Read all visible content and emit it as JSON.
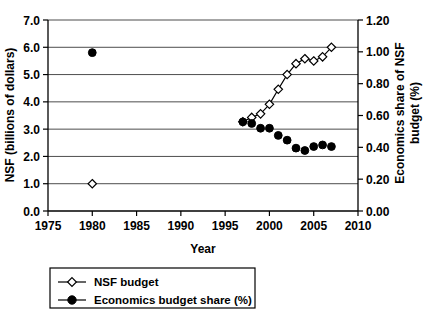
{
  "chart_data": {
    "type": "line",
    "title": "",
    "xlabel": "Year",
    "ylabel": "NSF (billions of dollars)",
    "y2label": "Economics share of NSF budget (%)",
    "xlim": [
      1975,
      2010
    ],
    "ylim": [
      0.0,
      7.0
    ],
    "y2lim": [
      0.0,
      1.2
    ],
    "grid": "horizontal",
    "legend_position": "bottom-left",
    "xticks": [
      "1975",
      "1980",
      "1985",
      "1990",
      "1995",
      "2000",
      "2005",
      "2010"
    ],
    "xtick_values": [
      1975,
      1980,
      1985,
      1990,
      1995,
      2000,
      2005,
      2010
    ],
    "yticks": [
      "0.0",
      "1.0",
      "2.0",
      "3.0",
      "4.0",
      "5.0",
      "6.0",
      "7.0"
    ],
    "ytick_values": [
      0.0,
      1.0,
      2.0,
      3.0,
      4.0,
      5.0,
      6.0,
      7.0
    ],
    "y2ticks": [
      "0.00",
      "0.20",
      "0.40",
      "0.60",
      "0.80",
      "1.00",
      "1.20"
    ],
    "y2tick_values": [
      0.0,
      0.2,
      0.4,
      0.6,
      0.8,
      1.0,
      1.2
    ],
    "series": [
      {
        "name": "NSF budget",
        "axis": "left",
        "marker": "open-diamond",
        "line": true,
        "x": [
          1997,
          1998,
          1999,
          2000,
          2001,
          2002,
          2003,
          2004,
          2005,
          2006,
          2007
        ],
        "values": [
          3.27,
          3.43,
          3.56,
          3.91,
          4.46,
          5.0,
          5.4,
          5.58,
          5.5,
          5.65,
          6.0
        ]
      },
      {
        "name": "NSF budget isolated point",
        "axis": "left",
        "marker": "open-diamond",
        "line": false,
        "x": [
          1980
        ],
        "values": [
          1.0
        ]
      },
      {
        "name": "Economics budget share (%)",
        "axis": "right",
        "marker": "filled-circle",
        "line": false,
        "x": [
          1997,
          1998,
          1999,
          2000,
          2001,
          2002,
          2003,
          2004,
          2005,
          2006,
          2007
        ],
        "values": [
          0.56,
          0.55,
          0.52,
          0.52,
          0.475,
          0.445,
          0.395,
          0.38,
          0.405,
          0.415,
          0.405
        ]
      },
      {
        "name": "Economics budget share isolated point",
        "axis": "right",
        "marker": "filled-circle",
        "line": false,
        "x": [
          1980
        ],
        "values": [
          0.995
        ]
      }
    ],
    "legend_entries": [
      {
        "label": "NSF budget",
        "marker": "open-diamond"
      },
      {
        "label": "Economics budget share (%)",
        "marker": "filled-circle"
      }
    ]
  }
}
